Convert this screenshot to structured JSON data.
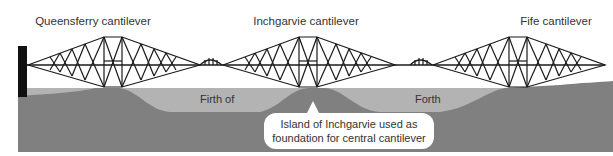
{
  "diagram": {
    "title_labels": [
      {
        "text": "Queensferry cantilever",
        "x": 93
      },
      {
        "text": "Inchgarvie cantilever",
        "x": 306
      },
      {
        "text": "Fife cantilever",
        "x": 525
      }
    ],
    "water_labels": {
      "left": "Firth of",
      "right": "Forth"
    },
    "callout": {
      "line1": "Island of Inchgarvie used as",
      "line2": "foundation for central cantilever"
    },
    "colors": {
      "water": "#b3b3b3",
      "land": "#808080",
      "truss": "#1a1a1a",
      "abutment": "#111111",
      "background": "#ffffff"
    }
  }
}
